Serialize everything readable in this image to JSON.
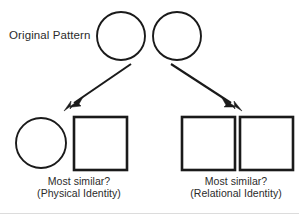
{
  "figure": {
    "type": "relational-match-to-sample-diagram",
    "background_color": "#ffffff",
    "stroke_color": "#1a1a1a",
    "text_color": "#2b2b2b",
    "labels": {
      "original_pattern": "Original Pattern"
    },
    "top_row": {
      "description": "Original pattern sample: two identical circles",
      "shapes": [
        {
          "name": "sample-circle-left",
          "kind": "circle",
          "cx": 121,
          "cy": 36,
          "r": 24
        },
        {
          "name": "sample-circle-right",
          "kind": "circle",
          "cx": 177,
          "cy": 36,
          "r": 24
        }
      ]
    },
    "arrows": [
      {
        "name": "arrow-to-left-choice",
        "direction": "down-left",
        "from_x": 131,
        "from_y": 64,
        "to_x": 66,
        "to_y": 110
      },
      {
        "name": "arrow-to-right-choice",
        "direction": "down-right",
        "from_x": 171,
        "from_y": 64,
        "to_x": 241,
        "to_y": 110
      }
    ],
    "bottom_left_option": {
      "shapes": [
        {
          "name": "choice-left-circle",
          "kind": "circle",
          "cx": 41,
          "cy": 143,
          "r": 25
        },
        {
          "name": "choice-left-square",
          "kind": "square",
          "x": 74,
          "y": 117,
          "size": 53
        }
      ],
      "caption_line_1": "Most similar?",
      "caption_line_2": "(Physical Identity)"
    },
    "bottom_right_option": {
      "shapes": [
        {
          "name": "choice-right-square-a",
          "kind": "square",
          "x": 182,
          "y": 117,
          "size": 53
        },
        {
          "name": "choice-right-square-b",
          "kind": "square",
          "x": 240,
          "y": 117,
          "size": 53
        }
      ],
      "caption_line_1": "Most similar?",
      "caption_line_2": "(Relational Identity)"
    }
  }
}
